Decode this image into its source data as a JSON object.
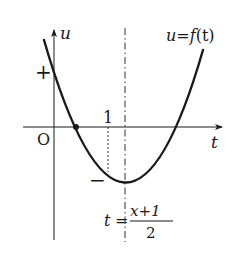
{
  "diagram": {
    "type": "function-graph",
    "axes": {
      "vertical_label": "u",
      "horizontal_label": "t",
      "origin_label": "O"
    },
    "curve": {
      "label": "u=f(t)",
      "label_parts": {
        "lhs": "u",
        "eq": "=",
        "func": "f",
        "arg": "(t)"
      },
      "shape": "upward parabola"
    },
    "sign_marks": {
      "positive": "+",
      "negative": "−"
    },
    "tick_label_one": "1",
    "axis_of_symmetry": {
      "lhs": "t",
      "eq": "=",
      "numerator": "x+1",
      "denominator": "2"
    },
    "colors": {
      "ink": "#1a1a1a",
      "background": "#ffffff"
    }
  }
}
